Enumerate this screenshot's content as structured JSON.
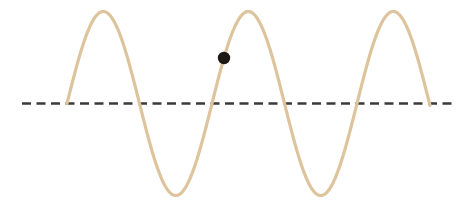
{
  "figure": {
    "title": "Transverse wave with a marked particle",
    "background_color": "#ffffff",
    "width": 473,
    "height": 206
  },
  "equilibrium_line": {
    "label": "equilibrium line",
    "color": "#3c3a38",
    "y": 103.5,
    "x_start": 22,
    "x_end": 456,
    "stroke_width": 2.4,
    "dash_length": 9,
    "gap_length": 5.5
  },
  "wave": {
    "label": "wave curve",
    "color": "#ddc49c",
    "stroke_width": 3.2,
    "amplitude": 92,
    "wavelength": 145,
    "midline_y": 103.5,
    "x_start": 67,
    "x_end": 430,
    "cycles": 2.5,
    "crests": [
      {
        "x": 103,
        "y": 12
      },
      {
        "x": 248,
        "y": 11
      },
      {
        "x": 394,
        "y": 11
      }
    ],
    "troughs": [
      {
        "x": 176,
        "y": 197
      },
      {
        "x": 321,
        "y": 196
      }
    ],
    "zero_crossings": [
      67,
      139,
      212,
      285,
      358,
      430
    ]
  },
  "marker": {
    "label": "particle marker",
    "color": "#1c1814",
    "x": 224,
    "y": 58,
    "radius": 6.2
  },
  "chart_data": {
    "type": "line",
    "title": "Transverse wave with a marked particle",
    "xlabel": "",
    "ylabel": "",
    "xlim": [
      22,
      456
    ],
    "ylim": [
      -100,
      100
    ],
    "grid": false,
    "legend": null,
    "series": [
      {
        "name": "wave curve",
        "color": "#ddc49c",
        "amplitude": 92,
        "wavelength": 145,
        "phase": "starts at zero rising",
        "x": [
          67,
          103,
          139,
          176,
          212,
          248,
          285,
          321,
          358,
          394,
          430
        ],
        "values": [
          0,
          92,
          0,
          -92,
          0,
          92,
          0,
          -92,
          0,
          92,
          0
        ]
      },
      {
        "name": "equilibrium line",
        "color": "#3c3a38",
        "style": "dashed",
        "x": [
          22,
          456
        ],
        "values": [
          0,
          0
        ]
      }
    ],
    "annotations": [
      {
        "name": "particle marker",
        "type": "point",
        "x": 224,
        "y": 46,
        "color": "#1c1814"
      }
    ]
  }
}
